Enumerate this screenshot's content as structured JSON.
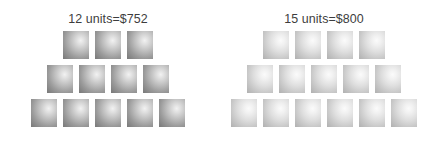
{
  "figure": {
    "background_color": "#ffffff",
    "text_color": "#3d3d3d",
    "type": "pictogram"
  },
  "groups": [
    {
      "id": "group-12-units",
      "label": "12 units=$752",
      "units_count": 12,
      "price": "$752",
      "units_text": "12 units",
      "tone": "tone-dark",
      "rows": [
        3,
        4,
        5
      ]
    },
    {
      "id": "group-15-units",
      "label": "15 units=$800",
      "units_count": 15,
      "price": "$800",
      "units_text": "15 units",
      "tone": "tone-light",
      "rows": [
        4,
        5,
        6
      ]
    }
  ],
  "chart_data": {
    "type": "bar",
    "title": "",
    "xlabel": "",
    "ylabel": "",
    "categories": [
      "12 units=$752",
      "15 units=$800"
    ],
    "values": [
      752,
      800
    ],
    "unit_counts": [
      12,
      15
    ],
    "annotations": [
      "12 units=$752",
      "15 units=$800"
    ],
    "legend": [],
    "grid": false
  }
}
